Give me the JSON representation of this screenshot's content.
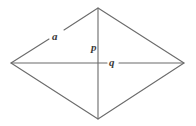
{
  "figure": {
    "name": "rhombus-with-diagonals",
    "type": "geometry-diagram",
    "background_color": "#ffffff",
    "stroke_color": "#6b6b6b",
    "label_color": "#3a3a3a",
    "canvas": {
      "width": 196,
      "height": 126
    }
  },
  "labels": {
    "side_a": "a",
    "diagonal_p": "p",
    "diagonal_q": "q"
  },
  "geometry": {
    "vertices": {
      "left": {
        "x": 11,
        "y": 63
      },
      "top": {
        "x": 98,
        "y": 8
      },
      "right": {
        "x": 184,
        "y": 63
      },
      "bottom": {
        "x": 98,
        "y": 119
      }
    },
    "center": {
      "x": 98,
      "y": 63
    },
    "edges": [
      {
        "name": "upper-left-edge",
        "from": "left",
        "to": "top",
        "label": "a",
        "label_gap": true
      },
      {
        "name": "upper-right-edge",
        "from": "top",
        "to": "right",
        "label": "",
        "label_gap": false
      },
      {
        "name": "lower-right-edge",
        "from": "right",
        "to": "bottom",
        "label": "",
        "label_gap": false
      },
      {
        "name": "lower-left-edge",
        "from": "bottom",
        "to": "left",
        "label": "",
        "label_gap": false
      }
    ],
    "diagonals": [
      {
        "name": "vertical-diagonal",
        "from": "top",
        "to": "bottom",
        "label": "p",
        "label_gap": false
      },
      {
        "name": "horizontal-diagonal",
        "from": "left",
        "to": "right",
        "label": "q",
        "label_gap": true
      }
    ]
  }
}
